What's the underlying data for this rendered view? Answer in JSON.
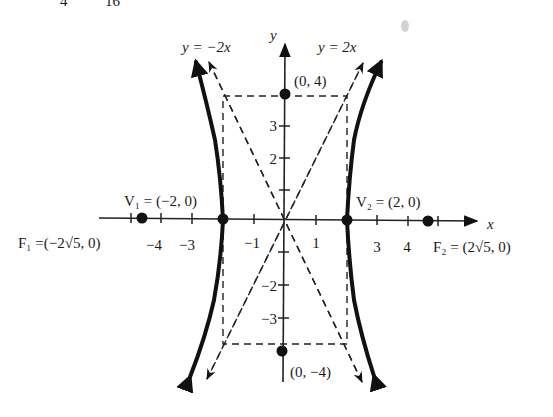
{
  "header_fragment": {
    "left": "4",
    "right": "16"
  },
  "equation": {
    "a": 2,
    "b": 4,
    "form": "x^2/4 - y^2/16 = 1"
  },
  "axes": {
    "x_label": "x",
    "y_label": "y",
    "x_ticks": [
      {
        "value": -5,
        "label": ""
      },
      {
        "value": -4,
        "label": "−4"
      },
      {
        "value": -3,
        "label": "−3"
      },
      {
        "value": -1,
        "label": "−1"
      },
      {
        "value": 1,
        "label": "1"
      },
      {
        "value": 3,
        "label": "3"
      },
      {
        "value": 4,
        "label": "4"
      },
      {
        "value": 5,
        "label": ""
      }
    ],
    "y_ticks": [
      {
        "value": 3,
        "label": "3"
      },
      {
        "value": 2,
        "label": "2"
      },
      {
        "value": 1,
        "label": ""
      },
      {
        "value": -1,
        "label": ""
      },
      {
        "value": -2,
        "label": "−2"
      },
      {
        "value": -3,
        "label": "−3"
      }
    ]
  },
  "asymptotes": [
    {
      "label": "y = −2x",
      "slope": -2
    },
    {
      "label": "y = 2x",
      "slope": 2
    }
  ],
  "points": {
    "v1": {
      "label": "V₁ = (−2, 0)",
      "x": -2,
      "y": 0
    },
    "v2": {
      "label": "V₂ = (2, 0)",
      "x": 2,
      "y": 0
    },
    "f1": {
      "label": "F₁ =(−2√5, 0)",
      "x": -4.472,
      "y": 0
    },
    "f2": {
      "label": "F₂ = (2√5, 0)",
      "x": 4.472,
      "y": 0
    },
    "b_top": {
      "label": "(0, 4)",
      "x": 0,
      "y": 4
    },
    "b_bottom": {
      "label": "(0, −4)",
      "x": 0,
      "y": -4
    }
  },
  "colors": {
    "ink": "#111111",
    "background": "#ffffff"
  }
}
